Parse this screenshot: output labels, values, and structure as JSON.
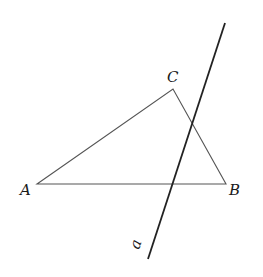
{
  "diagram": {
    "points": {
      "A": {
        "label": "A",
        "x": 37,
        "y": 184
      },
      "B": {
        "label": "B",
        "x": 226,
        "y": 184
      },
      "C": {
        "label": "C",
        "x": 173,
        "y": 89
      }
    },
    "line_a": {
      "label": "a",
      "x1": 225,
      "y1": 23,
      "x2": 148,
      "y2": 259
    },
    "colors": {
      "triangle": "#555555",
      "line": "#222222",
      "text": "#1a1a1a"
    }
  }
}
